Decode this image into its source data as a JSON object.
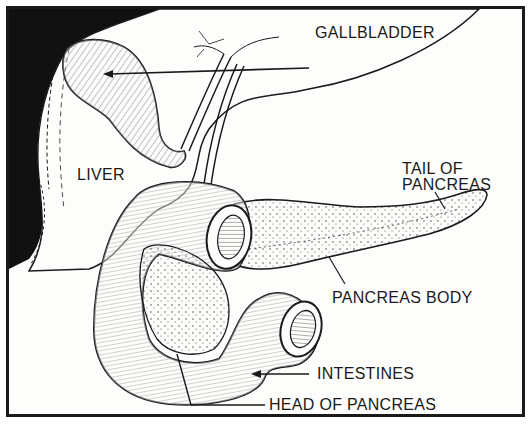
{
  "diagram": {
    "colors": {
      "ink": "#1a1a1a",
      "background": "#fdfdfb",
      "liver_shadow": "#111111"
    },
    "labels": {
      "gallbladder": "GALLBLADDER",
      "liver": "LIVER",
      "tail_of_pancreas_line1": "TAIL OF",
      "tail_of_pancreas_line2": "PANCREAS",
      "pancreas_body": "PANCREAS BODY",
      "intestines": "INTESTINES",
      "head_of_pancreas": "HEAD OF PANCREAS"
    }
  }
}
